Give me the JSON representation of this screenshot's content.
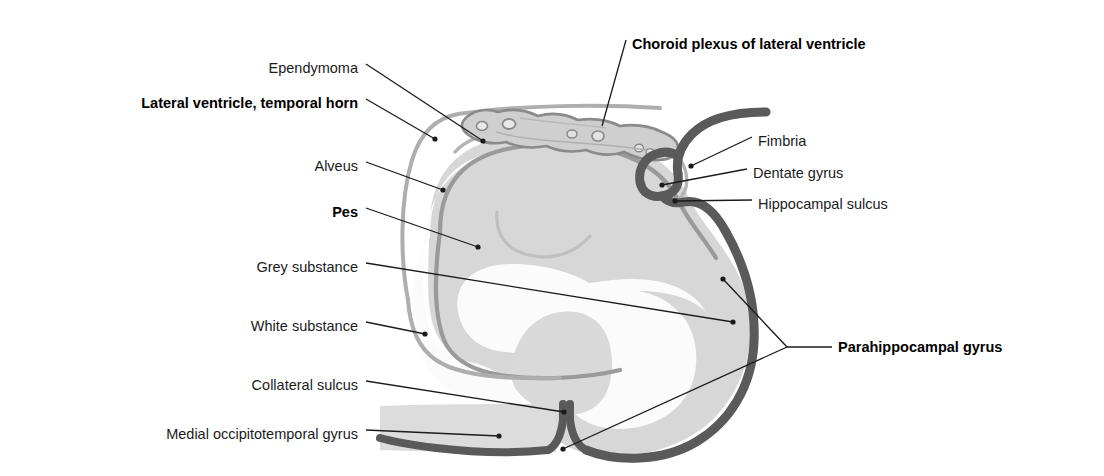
{
  "figure": {
    "background_color": "#ffffff",
    "palette": {
      "grey_substance": "#d7d7d7",
      "white_substance": "#f7f7f7",
      "cortical_band_dark": "#5a5a5a",
      "alveus_line": "#8f8f8f",
      "ependyma_line": "#aaaaaa",
      "choroid_plexus_fill": "#cfcfcf",
      "choroid_plexus_outline": "#8a8a8a",
      "leader_line": "#1b1b1b",
      "label_text": "#1b1b1b"
    }
  },
  "labels": {
    "left": [
      {
        "id": "ependymoma",
        "text": "Ependymoma",
        "bold": false,
        "x": 358,
        "y": 68,
        "tip_x": 483,
        "tip_y": 141
      },
      {
        "id": "lateral-ventricle",
        "text": "Lateral ventricle, temporal horn",
        "bold": true,
        "x": 358,
        "y": 103,
        "tip_x": 435,
        "tip_y": 139
      },
      {
        "id": "alveus",
        "text": "Alveus",
        "bold": false,
        "x": 358,
        "y": 166,
        "tip_x": 443,
        "tip_y": 190
      },
      {
        "id": "pes",
        "text": "Pes",
        "bold": true,
        "x": 358,
        "y": 212,
        "tip_x": 478,
        "tip_y": 247
      },
      {
        "id": "grey-substance",
        "text": "Grey substance",
        "bold": false,
        "x": 358,
        "y": 267,
        "tip_x": 733,
        "tip_y": 322
      },
      {
        "id": "white-substance",
        "text": "White substance",
        "bold": false,
        "x": 358,
        "y": 326,
        "tip_x": 425,
        "tip_y": 334
      },
      {
        "id": "collateral-sulcus",
        "text": "Collateral sulcus",
        "bold": false,
        "x": 358,
        "y": 385,
        "tip_x": 564,
        "tip_y": 412
      },
      {
        "id": "medial-occipitotemporal",
        "text": "Medial occipitotemporal gyrus",
        "bold": false,
        "x": 358,
        "y": 434,
        "tip_x": 499,
        "tip_y": 436
      }
    ],
    "right": [
      {
        "id": "choroid-plexus",
        "text": "Choroid plexus of lateral ventricle",
        "bold": true,
        "x": 632,
        "y": 44,
        "tip_x": 602,
        "tip_y": 126
      },
      {
        "id": "fimbria",
        "text": "Fimbria",
        "bold": false,
        "x": 758,
        "y": 141,
        "tip_x": 691,
        "tip_y": 166
      },
      {
        "id": "dentate-gyrus",
        "text": "Dentate gyrus",
        "bold": false,
        "x": 753,
        "y": 173,
        "tip_x": 662,
        "tip_y": 185
      },
      {
        "id": "hippocampal-sulcus",
        "text": "Hippocampal sulcus",
        "bold": false,
        "x": 758,
        "y": 204,
        "tip_x": 675,
        "tip_y": 201
      },
      {
        "id": "parahippocampal",
        "text": "Parahippocampal gyrus",
        "bold": true,
        "x": 838,
        "y": 350,
        "tip_x": 723,
        "tip_y": 279,
        "tip2_x": 563,
        "tip2_y": 449
      }
    ]
  }
}
